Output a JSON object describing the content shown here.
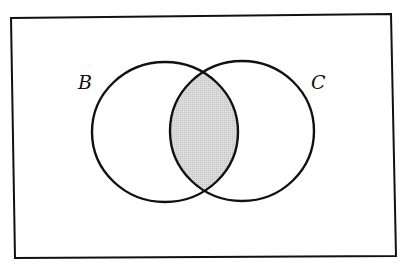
{
  "diagram": {
    "type": "venn",
    "sets": [
      {
        "id": "B",
        "label": "B"
      },
      {
        "id": "C",
        "label": "C"
      }
    ],
    "shaded_region": "B ∩ C",
    "colors": {
      "stroke": "#111111",
      "shade": "#d4d4d4",
      "background": "#ffffff"
    }
  }
}
